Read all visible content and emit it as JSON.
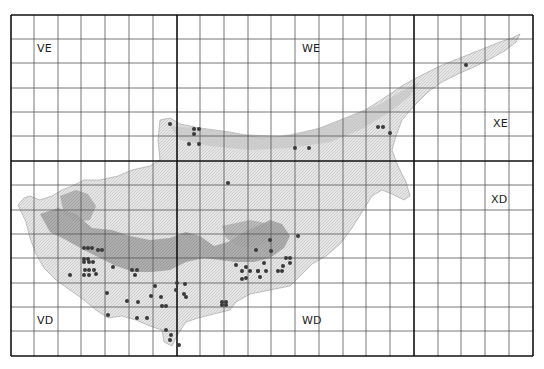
{
  "map": {
    "title": "",
    "frame": {
      "left": 11,
      "top": 15,
      "right": 533,
      "bottom": 356
    },
    "colors": {
      "grid_thin": "#555555",
      "grid_thick": "#111111",
      "land_light": "#dcdcdc",
      "land_mid": "#bdbdbd",
      "land_dark": "#8f8f8f",
      "dot": "#3a3a3a"
    },
    "grid": {
      "vertical": [
        11,
        34,
        58,
        81,
        105,
        129,
        153,
        177,
        200,
        224,
        248,
        271,
        295,
        319,
        343,
        366,
        390,
        414,
        438,
        461,
        485,
        509,
        533
      ],
      "horizontal": [
        15,
        39,
        63,
        88,
        112,
        136,
        161,
        185,
        210,
        234,
        258,
        283,
        307,
        331,
        356
      ],
      "thick_vertical": [
        11,
        177,
        414,
        533
      ],
      "thick_horizontal": [
        15,
        161,
        356
      ]
    },
    "zones": [
      {
        "code": "VE",
        "x": 37,
        "y": 48
      },
      {
        "code": "WE",
        "x": 302,
        "y": 48
      },
      {
        "code": "XE",
        "x": 493,
        "y": 117
      },
      {
        "code": "XD",
        "x": 491,
        "y": 193
      },
      {
        "code": "VD",
        "x": 37,
        "y": 314
      },
      {
        "code": "WD",
        "x": 302,
        "y": 314
      }
    ],
    "records": [
      [
        170,
        124
      ],
      [
        194,
        129
      ],
      [
        199,
        129
      ],
      [
        194,
        134
      ],
      [
        189,
        144
      ],
      [
        199,
        144
      ],
      [
        228,
        183
      ],
      [
        295,
        148
      ],
      [
        309,
        148
      ],
      [
        378,
        127
      ],
      [
        383,
        127
      ],
      [
        390,
        133
      ],
      [
        466,
        65
      ],
      [
        270,
        240
      ],
      [
        256,
        250
      ],
      [
        298,
        236
      ],
      [
        271,
        251
      ],
      [
        286,
        258
      ],
      [
        290,
        258
      ],
      [
        290,
        263
      ],
      [
        278,
        271
      ],
      [
        282,
        271
      ],
      [
        283,
        266
      ],
      [
        264,
        263
      ],
      [
        258,
        271
      ],
      [
        250,
        271
      ],
      [
        246,
        267
      ],
      [
        236,
        265
      ],
      [
        242,
        271
      ],
      [
        246,
        278
      ],
      [
        242,
        279
      ],
      [
        260,
        277
      ],
      [
        258,
        271
      ],
      [
        266,
        271
      ],
      [
        222,
        302
      ],
      [
        226,
        302
      ],
      [
        222,
        305
      ],
      [
        226,
        305
      ],
      [
        84,
        259
      ],
      [
        88,
        259
      ],
      [
        84,
        262
      ],
      [
        89,
        262
      ],
      [
        93,
        262
      ],
      [
        85,
        270
      ],
      [
        89,
        270
      ],
      [
        94,
        270
      ],
      [
        84,
        275
      ],
      [
        89,
        275
      ],
      [
        96,
        274
      ],
      [
        113,
        267
      ],
      [
        70,
        275
      ],
      [
        132,
        270
      ],
      [
        137,
        270
      ],
      [
        155,
        286
      ],
      [
        177,
        283
      ],
      [
        176,
        290
      ],
      [
        185,
        284
      ],
      [
        151,
        296
      ],
      [
        161,
        297
      ],
      [
        186,
        297
      ],
      [
        162,
        306
      ],
      [
        166,
        306
      ],
      [
        184,
        294
      ],
      [
        127,
        301
      ],
      [
        138,
        302
      ],
      [
        137,
        318
      ],
      [
        147,
        318
      ],
      [
        108,
        315
      ],
      [
        166,
        330
      ],
      [
        171,
        335
      ],
      [
        170,
        340
      ],
      [
        179,
        345
      ],
      [
        84,
        248
      ],
      [
        88,
        248
      ],
      [
        92,
        248
      ],
      [
        98,
        250
      ],
      [
        102,
        250
      ],
      [
        107,
        293
      ],
      [
        135,
        275
      ]
    ]
  }
}
